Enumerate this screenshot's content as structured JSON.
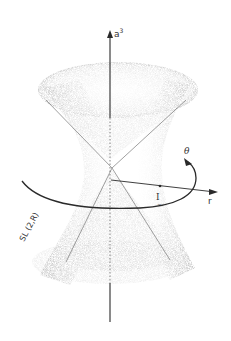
{
  "figure": {
    "labels": {
      "vertical_axis": "a",
      "vertical_axis_superscript": "3",
      "radial_axis": "r",
      "angle": "θ",
      "identity_point": "I",
      "group": "SL (2,R)"
    },
    "colors": {
      "ink": "#2a2a2a",
      "shade_dark": "#8a8a8a",
      "shade_light": "#d8d8d8",
      "background": "#ffffff"
    }
  }
}
